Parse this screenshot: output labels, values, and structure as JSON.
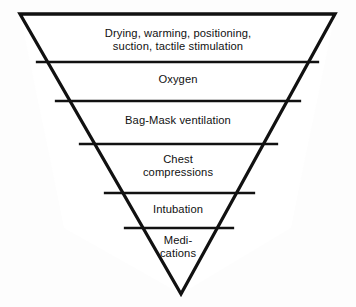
{
  "figure": {
    "type": "inverted-pyramid",
    "colors": {
      "outline": "#111111",
      "divider": "#111111",
      "background": "#fdfdfd",
      "text": "#111111"
    },
    "geometry": {
      "apex": [
        181,
        294
      ],
      "top_left": [
        20,
        14
      ],
      "top_right": [
        335,
        14
      ],
      "outline_width_px": 3.2,
      "divider_width_px": 2.2,
      "divider_y": [
        62,
        101,
        144,
        193,
        228
      ]
    },
    "bands": [
      {
        "index": 0,
        "name": "drying-warming-positioning",
        "label": "Drying, warming, positioning,\nsuction, tactile stimulation",
        "top_y": 14,
        "bottom_y": 62
      },
      {
        "index": 1,
        "name": "oxygen",
        "label": "Oxygen",
        "top_y": 62,
        "bottom_y": 101
      },
      {
        "index": 2,
        "name": "bag-mask-ventilation",
        "label": "Bag-Mask ventilation",
        "top_y": 101,
        "bottom_y": 144
      },
      {
        "index": 3,
        "name": "chest-compressions",
        "label": "Chest\ncompressions",
        "top_y": 144,
        "bottom_y": 193
      },
      {
        "index": 4,
        "name": "intubation",
        "label": "Intubation",
        "top_y": 193,
        "bottom_y": 228
      },
      {
        "index": 5,
        "name": "medications",
        "label": "Medi-\ncations",
        "top_y": 228,
        "bottom_y": 294
      }
    ]
  }
}
